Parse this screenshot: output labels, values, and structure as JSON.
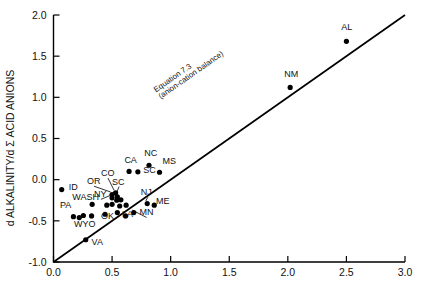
{
  "chart_data": {
    "type": "scatter",
    "title": "",
    "xlabel": "",
    "ylabel": "d ALKALINITY/d Σ ACID ANIONS",
    "xlim": [
      0.0,
      3.0
    ],
    "ylim": [
      -1.0,
      2.0
    ],
    "xticks": [
      "0.0",
      "0.5",
      "1.0",
      "1.5",
      "2.0",
      "2.5",
      "3.0"
    ],
    "xtick_values": [
      0.0,
      0.5,
      1.0,
      1.5,
      2.0,
      2.5,
      3.0
    ],
    "yticks": [
      "-1.0",
      "-0.5",
      "0.0",
      "0.5",
      "1.0",
      "1.5",
      "2.0"
    ],
    "ytick_values": [
      -1.0,
      -0.5,
      0.0,
      0.5,
      1.0,
      1.5,
      2.0
    ],
    "grid": false,
    "legend": "none",
    "line": {
      "label_line1": "Equation 7.3",
      "label_line2": "(anion-cation balance)",
      "slope": 1.0,
      "intercept": -1.0,
      "x_start": 0.0,
      "y_start": -1.0,
      "x_end": 3.0,
      "y_end": 2.0
    },
    "points": [
      {
        "label": "ID",
        "x": 0.07,
        "y": -0.12,
        "lx": 0.13,
        "ly": -0.12,
        "anchor": "start",
        "leader": false
      },
      {
        "label": "PA",
        "x": 0.17,
        "y": -0.45,
        "lx": 0.055,
        "ly": -0.35,
        "anchor": "start",
        "leader": false
      },
      {
        "label": "WYO",
        "x": 0.22,
        "y": -0.46,
        "lx": 0.175,
        "ly": -0.58,
        "anchor": "start",
        "leader": false
      },
      {
        "label": "WASH",
        "x": 0.33,
        "y": -0.3,
        "lx": 0.16,
        "ly": -0.245,
        "anchor": "start",
        "leader": false
      },
      {
        "label": "OR",
        "x": 0.5,
        "y": -0.18,
        "lx": 0.285,
        "ly": -0.055,
        "anchor": "start",
        "leader": true
      },
      {
        "label": "CO",
        "x": 0.53,
        "y": -0.16,
        "lx": 0.405,
        "ly": 0.045,
        "anchor": "start",
        "leader": true
      },
      {
        "label": "NY",
        "x": 0.5,
        "y": -0.22,
        "lx": 0.345,
        "ly": -0.215,
        "anchor": "start",
        "leader": true
      },
      {
        "label": "SC",
        "x": 0.545,
        "y": -0.21,
        "lx": 0.5,
        "ly": -0.06,
        "anchor": "start",
        "leader": true
      },
      {
        "label": "OK",
        "x": 0.44,
        "y": -0.42,
        "lx": 0.405,
        "ly": -0.475,
        "anchor": "start",
        "leader": false
      },
      {
        "label": "CA",
        "x": 0.645,
        "y": 0.1,
        "lx": 0.605,
        "ly": 0.205,
        "anchor": "start",
        "leader": false
      },
      {
        "label": "SC",
        "x": 0.72,
        "y": 0.095,
        "lx": 0.765,
        "ly": 0.085,
        "anchor": "start",
        "leader": false
      },
      {
        "label": "NC",
        "x": 0.815,
        "y": 0.175,
        "lx": 0.775,
        "ly": 0.285,
        "anchor": "start",
        "leader": false
      },
      {
        "label": "MS",
        "x": 0.905,
        "y": 0.09,
        "lx": 0.93,
        "ly": 0.195,
        "anchor": "start",
        "leader": false
      },
      {
        "label": "NJ",
        "x": 0.8,
        "y": -0.29,
        "lx": 0.745,
        "ly": -0.19,
        "anchor": "start",
        "leader": true
      },
      {
        "label": "ME",
        "x": 0.86,
        "y": -0.31,
        "lx": 0.875,
        "ly": -0.295,
        "anchor": "start",
        "leader": false
      },
      {
        "label": "MN",
        "x": 0.685,
        "y": -0.4,
        "lx": 0.735,
        "ly": -0.435,
        "anchor": "start",
        "leader": true
      },
      {
        "label": "LA",
        "x": 0.615,
        "y": -0.44,
        "lx": 0.585,
        "ly": -0.455,
        "anchor": "start",
        "leader": false
      },
      {
        "label": "VA",
        "x": 0.275,
        "y": -0.73,
        "lx": 0.325,
        "ly": -0.795,
        "anchor": "start",
        "leader": false
      },
      {
        "label": "NM",
        "x": 2.02,
        "y": 1.12,
        "lx": 1.97,
        "ly": 1.245,
        "anchor": "start",
        "leader": false
      },
      {
        "label": "AL",
        "x": 2.5,
        "y": 1.68,
        "lx": 2.455,
        "ly": 1.815,
        "anchor": "start",
        "leader": false
      },
      {
        "label": "",
        "x": 0.54,
        "y": -0.25,
        "leader": false
      },
      {
        "label": "",
        "x": 0.575,
        "y": -0.245,
        "leader": false
      },
      {
        "label": "",
        "x": 0.5,
        "y": -0.3,
        "leader": false
      },
      {
        "label": "",
        "x": 0.565,
        "y": -0.32,
        "leader": false
      },
      {
        "label": "",
        "x": 0.455,
        "y": -0.31,
        "leader": false
      },
      {
        "label": "",
        "x": 0.62,
        "y": -0.31,
        "leader": false
      },
      {
        "label": "",
        "x": 0.325,
        "y": -0.44,
        "leader": false
      },
      {
        "label": "",
        "x": 0.545,
        "y": -0.4,
        "leader": false
      },
      {
        "label": "",
        "x": 0.255,
        "y": -0.435,
        "leader": false
      }
    ]
  },
  "axes": {
    "y_title": "d ALKALINITY/d Σ ACID ANIONS"
  }
}
